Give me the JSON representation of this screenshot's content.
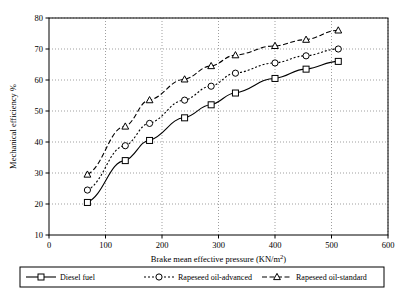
{
  "chart_data": {
    "type": "line",
    "title": "",
    "xlabel": "Brake mean effective pressure (KN/m2)",
    "ylabel": "Mechanical efficiency %",
    "xlim": [
      0,
      600
    ],
    "ylim": [
      10,
      80
    ],
    "xticks": [
      0,
      100,
      200,
      300,
      400,
      500,
      600
    ],
    "yticks": [
      10,
      20,
      30,
      40,
      50,
      60,
      70,
      80
    ],
    "grid": true,
    "legend_position": "bottom",
    "series": [
      {
        "name": "Diesel fuel",
        "marker": "square",
        "linestyle": "solid",
        "points": [
          {
            "x": 68,
            "y": 20.5
          },
          {
            "x": 135,
            "y": 34.0
          },
          {
            "x": 178,
            "y": 40.5
          },
          {
            "x": 240,
            "y": 47.8
          },
          {
            "x": 287,
            "y": 52.0
          },
          {
            "x": 330,
            "y": 55.8
          },
          {
            "x": 400,
            "y": 60.5
          },
          {
            "x": 455,
            "y": 63.5
          },
          {
            "x": 512,
            "y": 66.0
          }
        ]
      },
      {
        "name": "Rapeseed oil-advanced",
        "marker": "circle",
        "linestyle": "dotted",
        "points": [
          {
            "x": 68,
            "y": 24.5
          },
          {
            "x": 135,
            "y": 38.8
          },
          {
            "x": 178,
            "y": 46.0
          },
          {
            "x": 240,
            "y": 53.5
          },
          {
            "x": 287,
            "y": 58.0
          },
          {
            "x": 330,
            "y": 62.2
          },
          {
            "x": 400,
            "y": 65.5
          },
          {
            "x": 455,
            "y": 67.8
          },
          {
            "x": 512,
            "y": 70.0
          }
        ]
      },
      {
        "name": "Rapeseed oil-standard",
        "marker": "triangle",
        "linestyle": "dashed",
        "points": [
          {
            "x": 68,
            "y": 29.5
          },
          {
            "x": 135,
            "y": 45.0
          },
          {
            "x": 178,
            "y": 53.5
          },
          {
            "x": 240,
            "y": 60.2
          },
          {
            "x": 287,
            "y": 64.5
          },
          {
            "x": 330,
            "y": 68.0
          },
          {
            "x": 400,
            "y": 71.0
          },
          {
            "x": 455,
            "y": 73.0
          },
          {
            "x": 512,
            "y": 76.0
          }
        ]
      }
    ]
  },
  "legend": {
    "items": [
      {
        "label": "Diesel fuel"
      },
      {
        "label": "Rapeseed oil-advanced"
      },
      {
        "label": "Rapeseed oil-standard"
      }
    ]
  },
  "axes": {
    "x_title": "Brake mean effective pressure (KN/m",
    "x_title_sup": "2",
    "x_title_tail": ")",
    "y_title": "Mechanical efficiency %"
  }
}
